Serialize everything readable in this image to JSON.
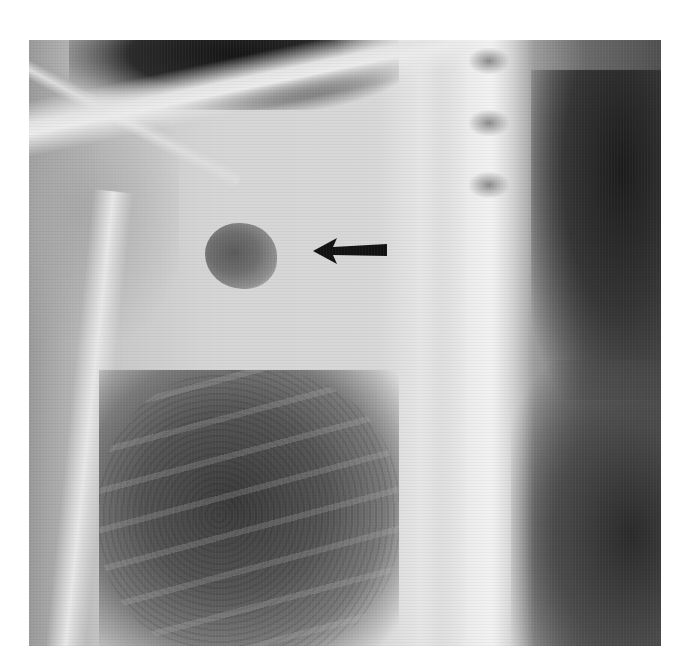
{
  "image": {
    "description": "Chest radiograph showing a rounded opacity/cavity in the upper lung field indicated by a black arrow",
    "modality": "X-ray",
    "annotations": [
      {
        "type": "arrow",
        "direction": "left",
        "color": "#000000",
        "points_to": "lesion"
      }
    ],
    "colors": {
      "background": "#ffffff",
      "lesion": "#5a5a5a",
      "arrow": "#111111"
    }
  }
}
